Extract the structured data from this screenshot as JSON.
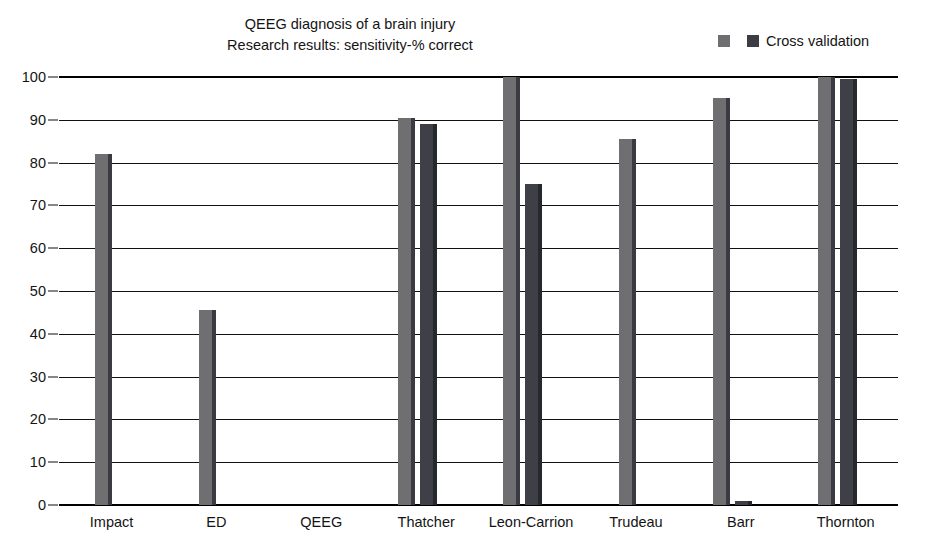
{
  "chart_data": {
    "type": "bar",
    "title": "QEEG diagnosis of a brain injury",
    "subtitle": "Research results: sensitivity-% correct",
    "xlabel": "",
    "ylabel": "",
    "ylim": [
      0,
      100
    ],
    "ytick_step": 10,
    "yticks": [
      100,
      90,
      80,
      70,
      60,
      50,
      40,
      30,
      20,
      10,
      0
    ],
    "grid": true,
    "legend_position": "top-right",
    "categories": [
      "Impact",
      "ED",
      "QEEG",
      "Thatcher",
      "Leon-Carrion",
      "Trudeau",
      "Barr",
      "Thornton"
    ],
    "series": [
      {
        "name": "Sensitivity",
        "color": "#6f6f72",
        "values": [
          82,
          45.5,
          0,
          90.5,
          100,
          85.5,
          95,
          100
        ]
      },
      {
        "name": "Cross validation",
        "color": "#3f3f47",
        "values": [
          0,
          0,
          0,
          89,
          75,
          0,
          1,
          99.5
        ]
      }
    ]
  },
  "title": {
    "line1": "QEEG diagnosis of a brain injury",
    "line2": "Research results: sensitivity-% correct"
  },
  "legend": {
    "items": [
      {
        "label": "",
        "color": "#6f6f72"
      },
      {
        "label": "Cross validation",
        "color": "#3f3f47"
      }
    ]
  },
  "axis": {
    "y_labels": [
      "100",
      "90",
      "80",
      "70",
      "60",
      "50",
      "40",
      "30",
      "20",
      "10",
      "0"
    ],
    "x_labels": [
      "Impact",
      "ED",
      "QEEG",
      "Thatcher",
      "Leon-Carrion",
      "Trudeau",
      "Barr",
      "Thornton"
    ]
  }
}
